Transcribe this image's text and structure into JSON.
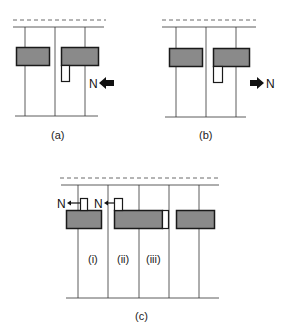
{
  "colors": {
    "line": "#333333",
    "bar_fill": "#8a8a8a",
    "bar_stroke": "#1a1a1a",
    "arrow": "#111111",
    "background": "#ffffff"
  },
  "panels": [
    {
      "id": "a",
      "caption": "(a)",
      "arrow_label": "N",
      "arrow_direction": "left",
      "arrow_style": "solid-block"
    },
    {
      "id": "b",
      "caption": "(b)",
      "arrow_label": "N",
      "arrow_direction": "right",
      "arrow_style": "solid-block"
    },
    {
      "id": "c",
      "caption": "(c)",
      "arrow_labels": [
        "N",
        "N"
      ],
      "arrow_direction": "left",
      "arrow_style": "thin",
      "region_labels": [
        "(i)",
        "(ii)",
        "(iii)"
      ]
    }
  ]
}
